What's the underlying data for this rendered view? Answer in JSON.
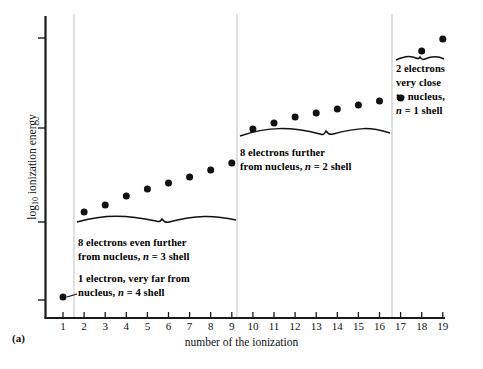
{
  "figure": {
    "panel_label": "(a)"
  },
  "chart_data": {
    "type": "scatter",
    "title": "",
    "xlabel": "number of the ionization",
    "ylabel": "log10 ionization energy",
    "ylabel_base": "log",
    "ylabel_sub": "10",
    "ylabel_rest": " ionization energy",
    "x": [
      1,
      2,
      3,
      4,
      5,
      6,
      7,
      8,
      9,
      10,
      11,
      12,
      13,
      14,
      15,
      16,
      17,
      18,
      19
    ],
    "xtick_labels": [
      "1",
      "2",
      "3",
      "4",
      "5",
      "6",
      "7",
      "8",
      "9",
      "10",
      "11",
      "12",
      "13",
      "14",
      "15",
      "16",
      "17",
      "18",
      "19"
    ],
    "values": [
      0.08,
      0.38,
      0.45,
      0.52,
      0.57,
      0.61,
      0.65,
      0.69,
      0.72,
      0.81,
      0.84,
      0.86,
      0.88,
      0.9,
      0.92,
      0.93,
      0.94,
      0.99,
      1.03
    ],
    "pixel_y": [
      297,
      212,
      205,
      196,
      189,
      183,
      177,
      170,
      163,
      129,
      123,
      117,
      113,
      109,
      105,
      101,
      98,
      51,
      39
    ],
    "xlim": [
      0.4,
      19.8
    ],
    "grid": false,
    "legend": "none",
    "marker": "filled-circle",
    "marker_color": "#111111",
    "ytick_count": 4,
    "ytick_labels": [
      "",
      "",
      "",
      ""
    ],
    "ytick_pixel_y": [
      38,
      128,
      222,
      300
    ],
    "axis_color": "#1a1a1a",
    "divider_color": "#bdbdbd",
    "divider_positions": [
      1.5,
      9.5,
      17.5
    ],
    "shell_groups": [
      {
        "name": "n=4",
        "ionizations": [
          1
        ],
        "electrons": 1
      },
      {
        "name": "n=3",
        "ionizations": [
          2,
          3,
          4,
          5,
          6,
          7,
          8,
          9
        ],
        "electrons": 8
      },
      {
        "name": "n=2",
        "ionizations": [
          10,
          11,
          12,
          13,
          14,
          15,
          16,
          17
        ],
        "electrons": 8
      },
      {
        "name": "n=1",
        "ionizations": [
          18,
          19
        ],
        "electrons": 2
      }
    ]
  },
  "annotations": {
    "n3_shell": {
      "line1": "8 electrons even further",
      "line2_pre": "from nucleus, ",
      "line2_italic": "n",
      "line2_post": " = 3 shell"
    },
    "n4_shell": {
      "line1": "1 electron, very far from",
      "line2_pre": "nucleus, ",
      "line2_italic": "n",
      "line2_post": " = 4 shell"
    },
    "n2_shell": {
      "line1": "8 electrons further",
      "line2_pre": "from nucleus, ",
      "line2_italic": "n",
      "line2_post": " = 2 shell"
    },
    "n1_shell": {
      "line1": "2 electrons",
      "line2": "very close",
      "line3": "to nucleus,",
      "line4_italic": "n",
      "line4_post": " = 1 shell"
    }
  }
}
